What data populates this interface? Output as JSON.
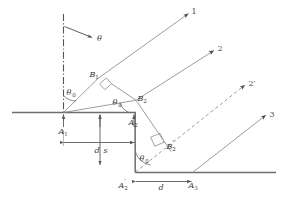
{
  "figure": {
    "background_color": "#ffffff",
    "line_color": "#808080",
    "heavy_line_color": "#6e6e6e",
    "label_color": "#3a3a3a",
    "width": 283,
    "height": 208
  },
  "labels": {
    "theta": "θ",
    "theta0_a1": "θ",
    "theta0_b2": "θ",
    "theta0_a2p": "θ",
    "theta_sub": "0",
    "B1": "B",
    "B1_sub": "1",
    "B2": "B",
    "B2_sub": "2",
    "B2p": "B",
    "B2p_sub": "2",
    "B2p_prime": "′",
    "A1": "A",
    "A1_sub": "1",
    "A2": "A",
    "A2_sub": "2",
    "A2p": "A",
    "A2p_sub": "2",
    "A2p_prime": "′",
    "A3": "A",
    "A3_sub": "3",
    "d_upper": "d",
    "d_lower": "d",
    "s": "s",
    "ray1": "1",
    "ray2": "2",
    "ray2p": "2′",
    "ray3": "3"
  },
  "rays": [
    {
      "name": "ray-1",
      "label": "1",
      "style": "solid"
    },
    {
      "name": "ray-2",
      "label": "2",
      "style": "solid"
    },
    {
      "name": "ray-2-prime",
      "label": "2′",
      "style": "dashed"
    },
    {
      "name": "ray-3",
      "label": "3",
      "style": "solid"
    }
  ],
  "dimensions": [
    {
      "name": "d-upper",
      "label": "d",
      "orientation": "horizontal"
    },
    {
      "name": "s-vertical",
      "label": "s",
      "orientation": "vertical"
    },
    {
      "name": "d-lower",
      "label": "d",
      "orientation": "horizontal"
    }
  ],
  "angles": [
    {
      "name": "incidence-angle-theta",
      "label": "θ"
    },
    {
      "name": "angle-theta0-at-A1",
      "label": "θ0"
    },
    {
      "name": "angle-theta0-at-B2",
      "label": "θ0"
    },
    {
      "name": "angle-theta0-at-A2-prime",
      "label": "θ0"
    }
  ],
  "points": [
    {
      "name": "point-A1",
      "label": "A1"
    },
    {
      "name": "point-A2",
      "label": "A2"
    },
    {
      "name": "point-A2-prime",
      "label": "A2′"
    },
    {
      "name": "point-A3",
      "label": "A3"
    },
    {
      "name": "point-B1",
      "label": "B1"
    },
    {
      "name": "point-B2",
      "label": "B2"
    },
    {
      "name": "point-B2-prime",
      "label": "B2′"
    }
  ]
}
